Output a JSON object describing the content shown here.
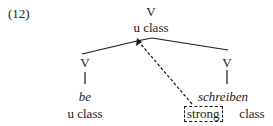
{
  "example_number": "(12)",
  "tree": {
    "root": {
      "label": "V",
      "feature": "u class"
    },
    "left": {
      "label": "V",
      "word": "be",
      "feature": "u class"
    },
    "right": {
      "label": "V",
      "word": "schreiben",
      "value": "strong",
      "feature": "class"
    }
  }
}
